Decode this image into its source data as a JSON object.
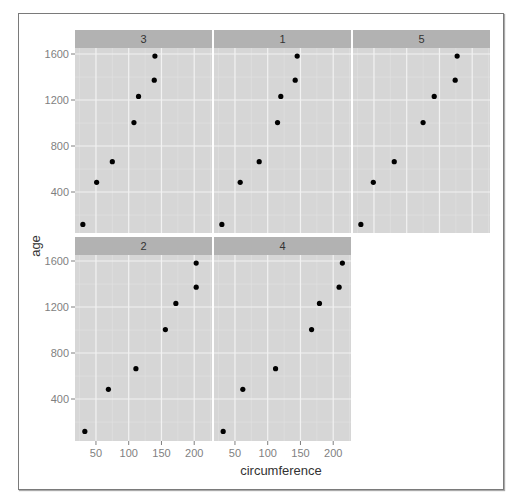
{
  "chart_data": {
    "type": "scatter",
    "title": "",
    "xlabel": "circumference",
    "ylabel": "age",
    "xlim": [
      18,
      227
    ],
    "ylim": [
      35,
      1660
    ],
    "x_ticks": [
      50,
      100,
      150,
      200
    ],
    "y_ticks": [
      400,
      800,
      1200,
      1600
    ],
    "grid": true,
    "layout": "facet_wrap 3 columns",
    "facets": [
      {
        "label": "3",
        "circumference": [
          30,
          51,
          75,
          108,
          115,
          139,
          140
        ],
        "age": [
          118,
          484,
          664,
          1004,
          1231,
          1372,
          1582
        ]
      },
      {
        "label": "1",
        "circumference": [
          30,
          58,
          87,
          115,
          120,
          142,
          145
        ],
        "age": [
          118,
          484,
          664,
          1004,
          1231,
          1372,
          1582
        ]
      },
      {
        "label": "5",
        "circumference": [
          30,
          49,
          81,
          125,
          142,
          174,
          177
        ],
        "age": [
          118,
          484,
          664,
          1004,
          1231,
          1372,
          1582
        ]
      },
      {
        "label": "2",
        "circumference": [
          33,
          69,
          111,
          156,
          172,
          203,
          203
        ],
        "age": [
          118,
          484,
          664,
          1004,
          1231,
          1372,
          1582
        ]
      },
      {
        "label": "4",
        "circumference": [
          32,
          62,
          112,
          167,
          179,
          209,
          214
        ],
        "age": [
          118,
          484,
          664,
          1004,
          1231,
          1372,
          1582
        ]
      }
    ]
  },
  "colors": {
    "panel_bg": "#d6d6d6",
    "strip_bg": "#b2b2b2",
    "grid_major": "#f2f2f2",
    "grid_minor": "#e2e2e2",
    "point": "#000000"
  }
}
